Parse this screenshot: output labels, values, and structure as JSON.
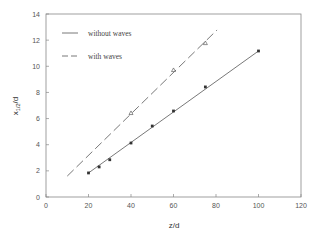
{
  "chart_data": {
    "type": "line",
    "title": "",
    "xlabel": "z/d",
    "ylabel": "x1/2/d",
    "ylabel_main": "x",
    "ylabel_sub": "1/2",
    "ylabel_tail": "/d",
    "xlim": [
      0,
      120
    ],
    "ylim": [
      0,
      14
    ],
    "xticks": [
      0,
      20,
      40,
      60,
      80,
      100,
      120
    ],
    "yticks": [
      0,
      2,
      4,
      6,
      8,
      10,
      12,
      14
    ],
    "grid": false,
    "legend_position": "upper-left",
    "series": [
      {
        "name": "without waves",
        "line_style": "solid",
        "marker": "filled-square",
        "color": "#555555",
        "points": [
          {
            "x": 20,
            "y": 1.84
          },
          {
            "x": 25,
            "y": 2.3
          },
          {
            "x": 30,
            "y": 2.85
          },
          {
            "x": 40,
            "y": 4.13
          },
          {
            "x": 50,
            "y": 5.43
          },
          {
            "x": 60,
            "y": 6.58
          },
          {
            "x": 75,
            "y": 8.42
          },
          {
            "x": 100,
            "y": 11.17
          }
        ],
        "fit_line": {
          "x0": 20,
          "y0": 1.84,
          "x1": 100,
          "y1": 11.17
        }
      },
      {
        "name": "with waves",
        "line_style": "dashed",
        "marker": "open-triangle",
        "color": "#555555",
        "points": [
          {
            "x": 40,
            "y": 6.43
          },
          {
            "x": 60,
            "y": 9.72
          },
          {
            "x": 75,
            "y": 11.78
          }
        ],
        "fit_line": {
          "x0": 10,
          "y0": 1.6,
          "x1": 80.5,
          "y1": 12.78
        }
      }
    ]
  },
  "legend": {
    "items": [
      {
        "label": "without waves",
        "style": "solid"
      },
      {
        "label": "with waves",
        "style": "dashed"
      }
    ]
  },
  "colors": {
    "axis": "#888888",
    "series": "#555555",
    "text": "#555555"
  }
}
